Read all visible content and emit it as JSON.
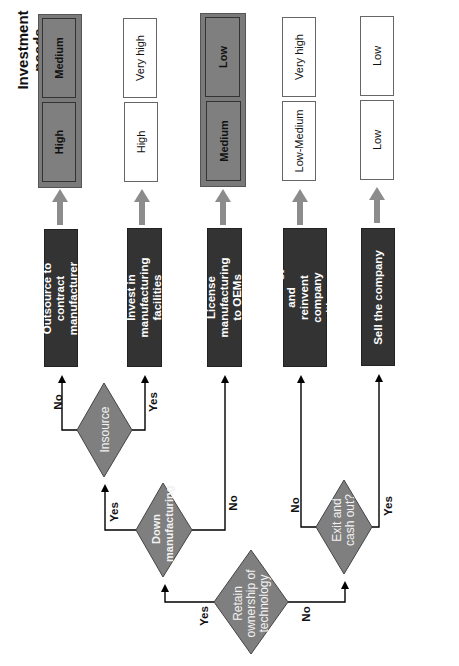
{
  "headers": {
    "valuation": "Valuation",
    "investment_needs": "Investment needs"
  },
  "outcomes": [
    {
      "action": "Outsource to contract manufacturer",
      "valuation": "High",
      "investment": "Medium",
      "highlighted": true
    },
    {
      "action": "Invest in manufacturing facilities",
      "valuation": "High",
      "investment": "Very high",
      "highlighted": false
    },
    {
      "action": "License manufacturing to OEMs",
      "valuation": "Medium",
      "investment": "Low",
      "highlighted": true
    },
    {
      "action": "Sell technology and reinvent company with new products",
      "valuation": "Low-Medium",
      "investment": "Very high",
      "highlighted": false
    },
    {
      "action": "Sell the company",
      "valuation": "Low",
      "investment": "Low",
      "highlighted": false
    }
  ],
  "decisions": {
    "retain": "Retain ownership of technology",
    "down": "Down manufacturing",
    "insource": "Insource",
    "exit": "Exit and cash out?"
  },
  "branch_labels": {
    "retain_yes": "Yes",
    "retain_no": "No",
    "down_yes": "Yes",
    "down_no": "No",
    "insource_no": "No",
    "insource_yes": "Yes",
    "exit_no": "No",
    "exit_yes": "Yes"
  },
  "colors": {
    "action_box": "#333333",
    "decision_fill": "#7f7f7f",
    "highlight_box": "#7f7f7f",
    "gray_arrow": "#8c8c8c"
  }
}
